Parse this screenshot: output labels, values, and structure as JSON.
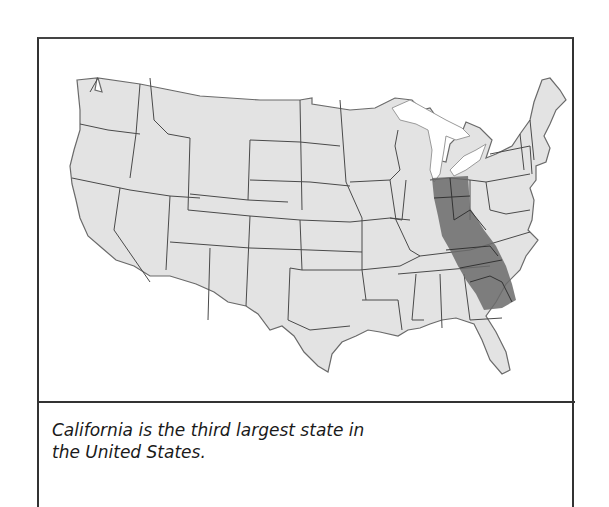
{
  "figure": {
    "caption": "California is the third largest state in the United States.",
    "caption_line1": "California is the third largest state in",
    "caption_line2": "the United States.",
    "map": {
      "subject": "Contiguous United States outline with state borders",
      "overlay": "California-shaped silhouette overlaid on the eastern United States (Michigan through Georgia/South Carolina)",
      "colors": {
        "land": "#e3e3e3",
        "border": "#4a4a4a",
        "overlay": "#6b6b6b",
        "water": "#ffffff"
      }
    }
  }
}
